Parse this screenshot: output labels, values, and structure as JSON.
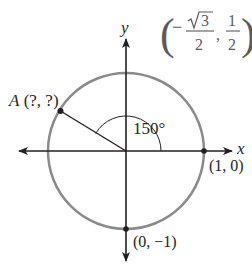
{
  "diagram": {
    "type": "unit-circle",
    "axes": {
      "x_label": "x",
      "y_label": "y"
    },
    "angle_label": "150°",
    "angle_degrees": 150,
    "points": {
      "A": {
        "name": "A",
        "coords_label": "(?, ?)"
      },
      "x_intercept": {
        "label": "(1, 0)"
      },
      "y_intercept": {
        "label": "(0, −1)"
      }
    },
    "reference_point": {
      "open_paren": "(",
      "minus": "−",
      "sqrt_numerator": "3",
      "denominator1": "2",
      "comma": ",",
      "numerator2": "1",
      "denominator2": "2",
      "close_paren": ")"
    },
    "colors": {
      "circle": "#8a8a8a",
      "axes": "#231f20",
      "text": "#231f20",
      "fraction_text": "#5a5a5a"
    }
  }
}
